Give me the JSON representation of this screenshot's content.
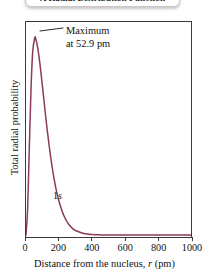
{
  "title": {
    "text": "A Radial Distribution Function"
  },
  "annotation": {
    "line1": "Maximum",
    "line2": "at 52.9 pm"
  },
  "orbital": {
    "n": "1",
    "l": "s"
  },
  "axes": {
    "x_title_prefix": "Distance from the nucleus, ",
    "x_title_var": "r",
    "x_title_suffix": " (pm)",
    "y_title": "Total radial probability",
    "x_ticks": [
      "0",
      "200",
      "400",
      "600",
      "800",
      "1000"
    ]
  },
  "colors": {
    "curve": "#8B3A5A",
    "frame": "#3a3a3a",
    "text": "#111111",
    "background": "#ffffff"
  },
  "chart_data": {
    "type": "line",
    "title": "A Radial Distribution Function",
    "xlabel": "Distance from the nucleus, r (pm)",
    "ylabel": "Total radial probability",
    "xlim": [
      0,
      1000
    ],
    "ylim": [
      0,
      1.06
    ],
    "xticks": [
      0,
      200,
      400,
      600,
      800,
      1000
    ],
    "yticks": [],
    "grid": false,
    "legend": null,
    "annotations": [
      {
        "text": "Maximum at 52.9 pm",
        "x": 52.9,
        "y": 1.0
      },
      {
        "text": "1s",
        "x": 150,
        "y": 0.21
      }
    ],
    "series": [
      {
        "name": "1s",
        "color": "#8B3A5A",
        "x": [
          0,
          10,
          20,
          30,
          40,
          52.9,
          60,
          70,
          80,
          90,
          100,
          110,
          120,
          130,
          140,
          150,
          160,
          170,
          180,
          190,
          200,
          220,
          240,
          260,
          280,
          300,
          350,
          400,
          450,
          500,
          600,
          700,
          800,
          900,
          1000
        ],
        "y": [
          0.0,
          0.136,
          0.438,
          0.729,
          0.921,
          1.0,
          0.991,
          0.954,
          0.897,
          0.827,
          0.751,
          0.673,
          0.596,
          0.523,
          0.455,
          0.392,
          0.336,
          0.286,
          0.242,
          0.204,
          0.171,
          0.118,
          0.08,
          0.053,
          0.035,
          0.023,
          0.0075,
          0.0023,
          0.0007,
          0.0002,
          0.0,
          0.0,
          0.0,
          0.0,
          0.0
        ]
      }
    ]
  }
}
